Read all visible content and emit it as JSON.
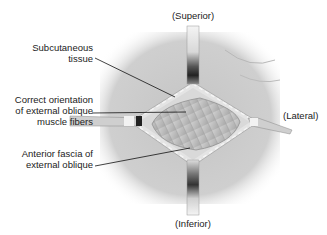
{
  "diagram": {
    "type": "anatomical-illustration",
    "orientation_labels": {
      "superior": "(Superior)",
      "inferior": "(Inferior)",
      "lateral": "(Lateral)"
    },
    "callouts": [
      {
        "id": "subcutaneous",
        "line1": "Subcutaneous",
        "line2": "tissue"
      },
      {
        "id": "muscle-fibers",
        "line1": "Correct orientation",
        "line2": "of external oblique",
        "line3": "muscle fibers"
      },
      {
        "id": "fascia",
        "line1": "Anterior fascia of",
        "line2": "external oblique"
      }
    ],
    "colors": {
      "skin": "#c9c9c9",
      "skin_dark": "#a8a8a8",
      "fascia": "#e2e2e2",
      "muscle": "#b5b5b5",
      "retractor_light": "#f0f0f0",
      "retractor_dark": "#2a2a2a",
      "leader_line": "#111111"
    }
  }
}
